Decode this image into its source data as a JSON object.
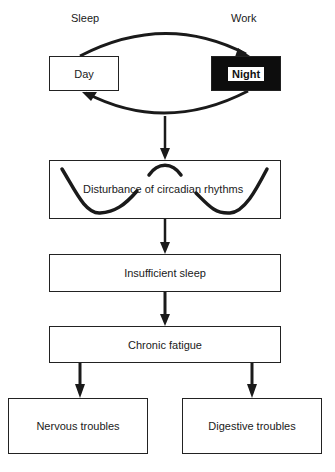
{
  "diagram": {
    "top_labels": {
      "left": "Sleep",
      "right": "Work"
    },
    "cycle": {
      "day_box": "Day",
      "night_box": "Night"
    },
    "flow": [
      {
        "id": "circadian",
        "label": "Disturbance of circadian rhythms"
      },
      {
        "id": "insufficient_sleep",
        "label": "Insufficient sleep"
      },
      {
        "id": "chronic_fatigue",
        "label": "Chronic fatigue"
      }
    ],
    "outcomes": [
      {
        "id": "nervous",
        "label": "Nervous troubles"
      },
      {
        "id": "digestive",
        "label": "Digestive troubles"
      }
    ],
    "colors": {
      "line": "#1a1a1a",
      "background": "#ffffff",
      "night_fill": "#0d0d0d"
    }
  }
}
